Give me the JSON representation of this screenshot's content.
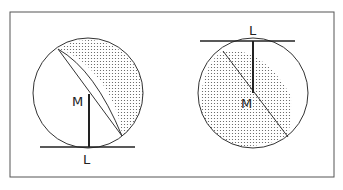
{
  "diagram": {
    "left": {
      "label_top": "M",
      "label_bottom": "L"
    },
    "right": {
      "label_top": "L",
      "label_bottom": "M"
    }
  },
  "colors": {
    "stroke": "#333333",
    "background": "#ffffff",
    "dots": "#555555"
  }
}
